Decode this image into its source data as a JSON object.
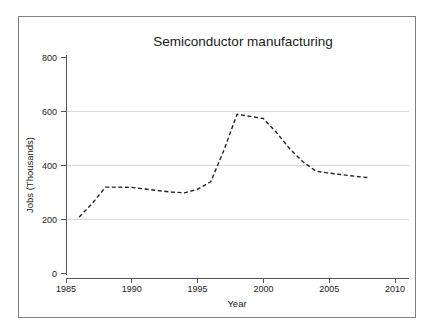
{
  "chart_data": {
    "type": "line",
    "title": "Semiconductor manufacturing",
    "xlabel": "Year",
    "ylabel": "Jobs (Thousands)",
    "xlim": [
      1984.4,
      2010.6
    ],
    "ylim": [
      0,
      830
    ],
    "grid": true,
    "grid_axis": "y",
    "legend": false,
    "line_style": "dashed",
    "line_color": "#222222",
    "grid_color": "#d9d9d9",
    "axis_color": "#555555",
    "xticks": [
      1985,
      1990,
      1995,
      2000,
      2005,
      2010
    ],
    "xtick_labels": [
      "1985",
      "1990",
      "1995",
      "2000",
      "2005",
      "2010"
    ],
    "yticks": [
      0,
      200,
      400,
      600,
      800
    ],
    "ytick_labels": [
      "0",
      "200",
      "400",
      "600",
      "800"
    ],
    "gridlines": [
      200,
      400,
      600
    ],
    "series": [
      {
        "name": "Semiconductor manufacturing jobs",
        "x": [
          1986,
          1987,
          1988,
          1989,
          1990,
          1991,
          1992,
          1993,
          1994,
          1995,
          1996,
          1997,
          1998,
          1999,
          2000,
          2001,
          2002,
          2003,
          2004,
          2005,
          2006,
          2007,
          2008
        ],
        "values": [
          207,
          258,
          318,
          318,
          317,
          311,
          305,
          300,
          297,
          310,
          338,
          455,
          588,
          580,
          572,
          520,
          460,
          412,
          377,
          370,
          364,
          358,
          353
        ]
      }
    ]
  },
  "figure": {
    "background": "#ffffff",
    "frame_color": "#808080"
  }
}
